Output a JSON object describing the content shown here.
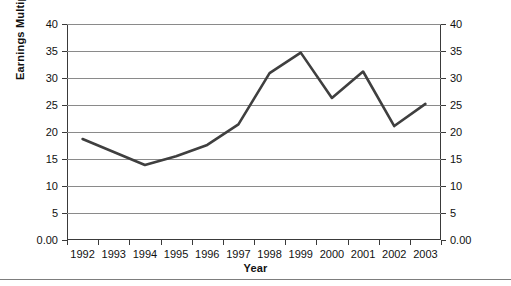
{
  "chart_data": {
    "type": "line",
    "title": "",
    "xlabel": "Year",
    "ylabel": "Earnings Multiple",
    "categories": [
      "1992",
      "1993",
      "1994",
      "1995",
      "1996",
      "1997",
      "1998",
      "1999",
      "2000",
      "2001",
      "2002",
      "2003"
    ],
    "values": [
      18.7,
      16.3,
      13.9,
      15.5,
      17.6,
      21.4,
      30.9,
      34.7,
      26.3,
      31.2,
      21.1,
      25.2
    ],
    "series": [
      {
        "name": "Earnings Multiple",
        "values": [
          18.7,
          16.3,
          13.9,
          15.5,
          17.6,
          21.4,
          30.9,
          34.7,
          26.3,
          31.2,
          21.1,
          25.2
        ],
        "color": "#3f3f3f"
      }
    ],
    "ylim": [
      0,
      40
    ],
    "ytick_labels_left": [
      "40",
      "35",
      "30",
      "25",
      "20",
      "15",
      "10",
      "5",
      "0.00"
    ],
    "ytick_labels_right": [
      "40",
      "35",
      "30",
      "25",
      "20",
      "15",
      "10",
      "5",
      "0.00"
    ],
    "ytick_values": [
      40,
      35,
      30,
      25,
      20,
      15,
      10,
      5,
      0
    ],
    "grid": true,
    "grid_axis": "y",
    "legend": false,
    "legend_position": "none",
    "dual_y_axis": true,
    "line_color": "#3f3f3f",
    "grid_color": "#8a8a8a",
    "axis_color": "#3a3a3a",
    "background": "#ffffff"
  }
}
